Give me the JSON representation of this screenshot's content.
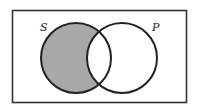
{
  "diagram": {
    "type": "venn",
    "sets": [
      {
        "label": "S",
        "shaded_region": "S only (S minus P)"
      },
      {
        "label": "P",
        "shaded_region": "none"
      }
    ],
    "shade_color": "#a8a8a8",
    "stroke_color": "#222222"
  }
}
